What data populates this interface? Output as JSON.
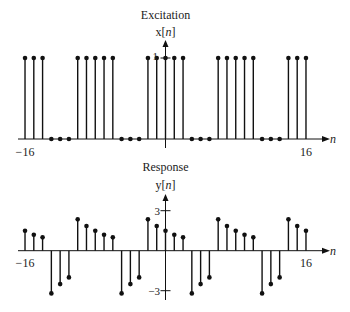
{
  "chart_data": [
    {
      "type": "stem",
      "title": "Excitation",
      "ylabel": "x[n]",
      "xlabel": "n",
      "x_tick_labels": [
        "-16",
        "16"
      ],
      "y_tick_labels": [
        "1"
      ],
      "xlim": [
        -16,
        16
      ],
      "ylim": [
        0,
        1
      ],
      "grid": false,
      "n": [
        -16,
        -15,
        -14,
        -13,
        -12,
        -11,
        -10,
        -9,
        -8,
        -7,
        -6,
        -5,
        -4,
        -3,
        -2,
        -1,
        0,
        1,
        2,
        3,
        4,
        5,
        6,
        7,
        8,
        9,
        10,
        11,
        12,
        13,
        14,
        15,
        16
      ],
      "values": [
        1,
        1,
        1,
        0,
        0,
        0,
        1,
        1,
        1,
        1,
        1,
        0,
        0,
        0,
        1,
        1,
        1,
        1,
        1,
        0,
        0,
        0,
        1,
        1,
        1,
        1,
        1,
        0,
        0,
        0,
        1,
        1,
        1
      ]
    },
    {
      "type": "stem",
      "title": "Response",
      "ylabel": "y[n]",
      "xlabel": "n",
      "x_tick_labels": [
        "-16",
        "16"
      ],
      "y_tick_labels": [
        "3",
        "-3"
      ],
      "xlim": [
        -16,
        16
      ],
      "ylim": [
        -3,
        3
      ],
      "grid": false,
      "n": [
        -16,
        -15,
        -14,
        -13,
        -12,
        -11,
        -10,
        -9,
        -8,
        -7,
        -6,
        -5,
        -4,
        -3,
        -2,
        -1,
        0,
        1,
        2,
        3,
        4,
        5,
        6,
        7,
        8,
        9,
        10,
        11,
        12,
        13,
        14,
        15,
        16
      ],
      "values": [
        1.5,
        1.2,
        1.0,
        -3.2,
        -2.5,
        -2.0,
        2.35,
        1.85,
        1.5,
        1.2,
        1.0,
        -3.2,
        -2.5,
        -2.0,
        2.35,
        1.85,
        1.5,
        1.2,
        1.0,
        -3.2,
        -2.5,
        -2.0,
        2.35,
        1.85,
        1.5,
        1.2,
        1.0,
        -3.2,
        -2.5,
        -2.0,
        2.35,
        1.85,
        1.5
      ]
    }
  ],
  "labels": {
    "top_title": "Excitation",
    "top_ylabel_prefix": "x[",
    "top_ylabel_var": "n",
    "top_ylabel_suffix": "]",
    "top_ytick": "1",
    "bottom_title": "Response",
    "bottom_ylabel_prefix": "y[",
    "bottom_ylabel_var": "n",
    "bottom_ylabel_suffix": "]",
    "bottom_ytick_pos": "3",
    "bottom_ytick_neg": "−3",
    "xtick_left": "−16",
    "xtick_right": "16",
    "xaxis_var": "n"
  },
  "colors": {
    "ink": "#111111",
    "background": "#ffffff"
  }
}
